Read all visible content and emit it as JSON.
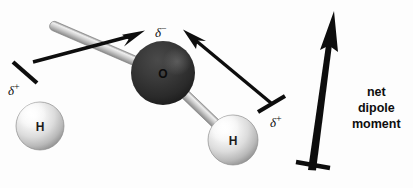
{
  "figure": {
    "background_color": "#fdfdfd",
    "ink_color": "#0d0d0d"
  },
  "atoms": [
    {
      "id": "hydrogen-left",
      "label": "H",
      "cx": 40,
      "cy": 126,
      "r": 24,
      "fill": "#e9e9e9",
      "charge_label": "δ",
      "charge_sign": "+",
      "charge_x": 8,
      "charge_y": 82
    },
    {
      "id": "oxygen",
      "label": "O",
      "cx": 163,
      "cy": 73,
      "r": 32,
      "fill": "#2e2e2e",
      "charge_label": "δ",
      "charge_sign": "−",
      "charge_x": 155,
      "charge_y": 24
    },
    {
      "id": "hydrogen-right",
      "label": "H",
      "cx": 233,
      "cy": 140,
      "r": 25,
      "fill": "#e9e9e9",
      "charge_label": "δ",
      "charge_sign": "+",
      "charge_x": 270,
      "charge_y": 114
    }
  ],
  "bonds": [
    {
      "id": "bond-o-h-left",
      "x1": 163,
      "y1": 73,
      "x2": 40,
      "y2": 126,
      "width": 9
    },
    {
      "id": "bond-o-h-right",
      "x1": 163,
      "y1": 73,
      "x2": 233,
      "y2": 140,
      "width": 9
    }
  ],
  "bond_dipole_arrows": [
    {
      "id": "bond-dipole-arrow-left",
      "direction": "toward oxygen, up-right",
      "tail_x": 33,
      "tail_y": 61,
      "tip_x": 144,
      "tip_y": 31,
      "crossbar_at": 0.1
    },
    {
      "id": "bond-dipole-arrow-right",
      "direction": "toward oxygen, up-left",
      "tail_x": 272,
      "tail_y": 104,
      "tip_x": 184,
      "tip_y": 30,
      "crossbar_at": 0.1
    }
  ],
  "net_dipole_arrow": {
    "id": "net-dipole-arrow",
    "tail_x": 310,
    "tail_y": 172,
    "tip_x": 334,
    "tip_y": 11,
    "crossbar_at": 0.03
  },
  "caption": {
    "text": "net\ndipole\nmoment",
    "lines": [
      "net",
      "dipole",
      "moment"
    ],
    "x": 352,
    "y": 84
  }
}
